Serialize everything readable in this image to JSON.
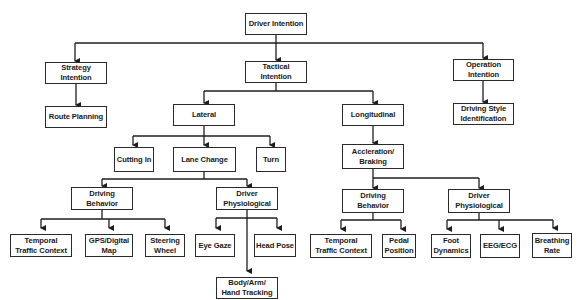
{
  "diagram": {
    "title": "Driver Intention",
    "nodes": {
      "root": "Driver Intention",
      "strategy": "Strategy\nIntention",
      "tactical": "Tactical\nIntention",
      "operation": "Operation\nIntention",
      "route_planning": "Route Planning",
      "lateral": "Lateral",
      "longitudinal": "Longitudinal",
      "driving_style": "Driving Style\nIdentification",
      "cutting_in": "Cutting In",
      "lane_change": "Lane Change",
      "turn": "Turn",
      "accel_braking": "Accleration/\nBraking",
      "lc_driving_behavior": "Driving\nBehavior",
      "lc_driver_physiological": "Driver\nPhysiological",
      "ab_driving_behavior": "Driving\nBehavior",
      "ab_driver_physiological": "Driver\nPhysiological",
      "lc_temporal_traffic": "Temporal\nTraffic Context",
      "gps_map": "GPS/Digital\nMap",
      "steering_wheel": "Steering\nWheel",
      "eye_gaze": "Eye Gaze",
      "head_pose": "Head Pose",
      "body_tracking": "Body/Arm/\nHand Tracking",
      "ab_temporal_traffic": "Temporal\nTraffic Context",
      "pedal_position": "Pedal\nPosition",
      "foot_dynamics": "Foot\nDynamics",
      "eeg_ecg": "EEG/ECG",
      "breathing_rate": "Breathing\nRate"
    },
    "edges": [
      [
        "root",
        "strategy"
      ],
      [
        "root",
        "tactical"
      ],
      [
        "root",
        "operation"
      ],
      [
        "strategy",
        "route_planning"
      ],
      [
        "tactical",
        "lateral"
      ],
      [
        "tactical",
        "longitudinal"
      ],
      [
        "operation",
        "driving_style"
      ],
      [
        "lateral",
        "cutting_in"
      ],
      [
        "lateral",
        "lane_change"
      ],
      [
        "lateral",
        "turn"
      ],
      [
        "longitudinal",
        "accel_braking"
      ],
      [
        "lane_change",
        "lc_driving_behavior"
      ],
      [
        "lane_change",
        "lc_driver_physiological"
      ],
      [
        "lc_driving_behavior",
        "lc_temporal_traffic"
      ],
      [
        "lc_driving_behavior",
        "gps_map"
      ],
      [
        "lc_driving_behavior",
        "steering_wheel"
      ],
      [
        "lc_driver_physiological",
        "eye_gaze"
      ],
      [
        "lc_driver_physiological",
        "head_pose"
      ],
      [
        "lc_driver_physiological",
        "body_tracking"
      ],
      [
        "accel_braking",
        "ab_driving_behavior"
      ],
      [
        "accel_braking",
        "ab_driver_physiological"
      ],
      [
        "ab_driving_behavior",
        "ab_temporal_traffic"
      ],
      [
        "ab_driving_behavior",
        "pedal_position"
      ],
      [
        "ab_driver_physiological",
        "foot_dynamics"
      ],
      [
        "ab_driver_physiological",
        "eeg_ecg"
      ],
      [
        "ab_driver_physiological",
        "breathing_rate"
      ]
    ],
    "colors": {
      "line": "#1e1e1e",
      "border": "#2a2a2a",
      "text": "#1a1a1a",
      "background": "#ffffff"
    }
  }
}
